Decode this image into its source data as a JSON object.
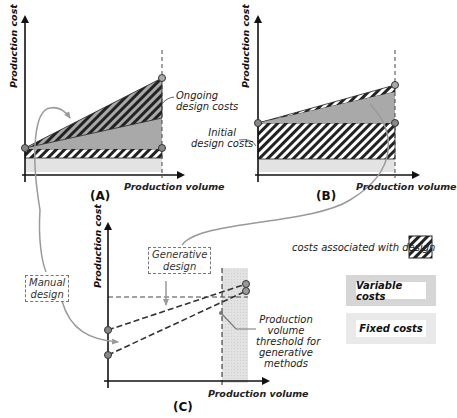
{
  "panels": {
    "A": {
      "label": "(A)",
      "ylabel": "Production cost",
      "xlabel": "Production volume",
      "annotations": {
        "ongoing": "Ongoing\ndesign costs"
      }
    },
    "B": {
      "label": "(B)",
      "ylabel": "Production cost",
      "xlabel": "Production volume",
      "annotations": {
        "initial": "Initial\ndesign costs"
      }
    },
    "C": {
      "label": "(C)",
      "ylabel": "Production cost",
      "xlabel": "Production volume",
      "annotations": {
        "manual": "Manual\ndesign",
        "generative": "Generative\ndesign",
        "threshold": "Production\nvolume\nthreshold for\ngenerative\nmethods"
      }
    }
  },
  "legend": {
    "design_costs": "costs associated with design",
    "variable_costs": "Variable costs",
    "fixed_costs": "Fixed costs"
  },
  "colors": {
    "variable": "#a9a9a9",
    "fixed": "#e3e3e3",
    "hatch_dark": "#222222",
    "arrow_gray": "#9a9a9a",
    "threshold_shade": "#e0e0e0"
  }
}
